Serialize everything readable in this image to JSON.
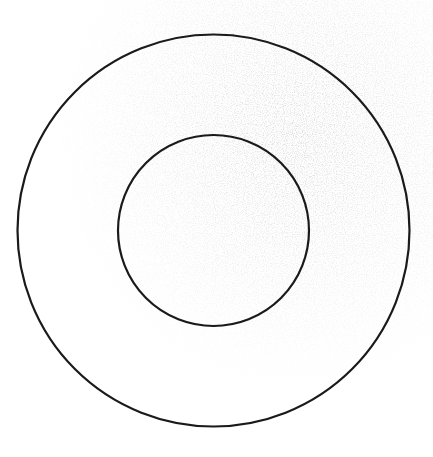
{
  "diagram": {
    "type": "concentric-circles",
    "background": "#ffffff",
    "stroke_color": "#1a1a1a",
    "stroke_width": 2.2,
    "shapes": [
      {
        "name": "outer-circle",
        "cx": 213.5,
        "cy": 230.5,
        "r": 196
      },
      {
        "name": "inner-circle",
        "cx": 213.5,
        "cy": 230.5,
        "r": 95.5
      }
    ],
    "labels": []
  }
}
